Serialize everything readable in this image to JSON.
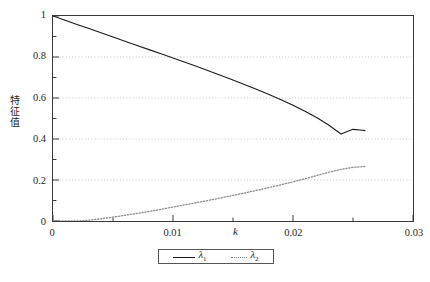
{
  "chart_data": {
    "type": "line",
    "title": "",
    "xlabel": "k",
    "ylabel": "特征值",
    "xlim": [
      0,
      0.03
    ],
    "ylim": [
      0,
      1
    ],
    "grid": "horizontal-dotted",
    "legend_position": "below-center",
    "x_major_ticks": [
      "0",
      "0.01",
      "0.02",
      "0.03"
    ],
    "x_major_values": [
      0,
      0.01,
      0.02,
      0.03
    ],
    "x_minor_values": [
      0.005,
      0.015,
      0.025
    ],
    "y_major_ticks": [
      "0",
      "0.2",
      "0.4",
      "0.6",
      "0.8",
      "1"
    ],
    "y_major_values": [
      0,
      0.2,
      0.4,
      0.6,
      0.8,
      1
    ],
    "y_minor_values": [
      0.1,
      0.3,
      0.5,
      0.7,
      0.9
    ],
    "series": [
      {
        "name": "λ1",
        "label_base": "λ",
        "label_sub": "1",
        "style": "solid",
        "color": "#1a1a1a",
        "x": [
          0,
          0.001,
          0.002,
          0.003,
          0.004,
          0.005,
          0.006,
          0.007,
          0.008,
          0.009,
          0.01,
          0.011,
          0.012,
          0.013,
          0.014,
          0.015,
          0.016,
          0.017,
          0.018,
          0.019,
          0.02,
          0.021,
          0.022,
          0.023,
          0.024,
          0.025,
          0.0258,
          0.026
        ],
        "values": [
          1.0,
          0.9795,
          0.959,
          0.9385,
          0.918,
          0.8975,
          0.877,
          0.8565,
          0.836,
          0.8155,
          0.795,
          0.7742,
          0.7532,
          0.7318,
          0.71,
          0.6878,
          0.665,
          0.6415,
          0.617,
          0.5915,
          0.5645,
          0.5355,
          0.5035,
          0.4672,
          0.4245,
          0.447,
          0.4425,
          0.441
        ]
      },
      {
        "name": "λ2",
        "label_base": "λ",
        "label_sub": "2",
        "style": "dotted",
        "color": "#8a8a8a",
        "x": [
          0,
          0.001,
          0.002,
          0.003,
          0.004,
          0.005,
          0.006,
          0.007,
          0.008,
          0.009,
          0.01,
          0.011,
          0.012,
          0.013,
          0.014,
          0.015,
          0.016,
          0.017,
          0.018,
          0.019,
          0.02,
          0.021,
          0.022,
          0.023,
          0.024,
          0.025,
          0.0258,
          0.026
        ],
        "values": [
          0.0,
          0.0,
          0.0,
          0.004,
          0.011,
          0.019,
          0.028,
          0.037,
          0.047,
          0.057,
          0.068,
          0.079,
          0.09,
          0.101,
          0.113,
          0.125,
          0.137,
          0.15,
          0.163,
          0.177,
          0.191,
          0.206,
          0.222,
          0.238,
          0.252,
          0.262,
          0.265,
          0.266
        ]
      }
    ]
  },
  "legend": {
    "entries": [
      {
        "text_base": "λ",
        "text_sub": "1",
        "style": "solid"
      },
      {
        "text_base": "λ",
        "text_sub": "2",
        "style": "dotted"
      }
    ]
  }
}
